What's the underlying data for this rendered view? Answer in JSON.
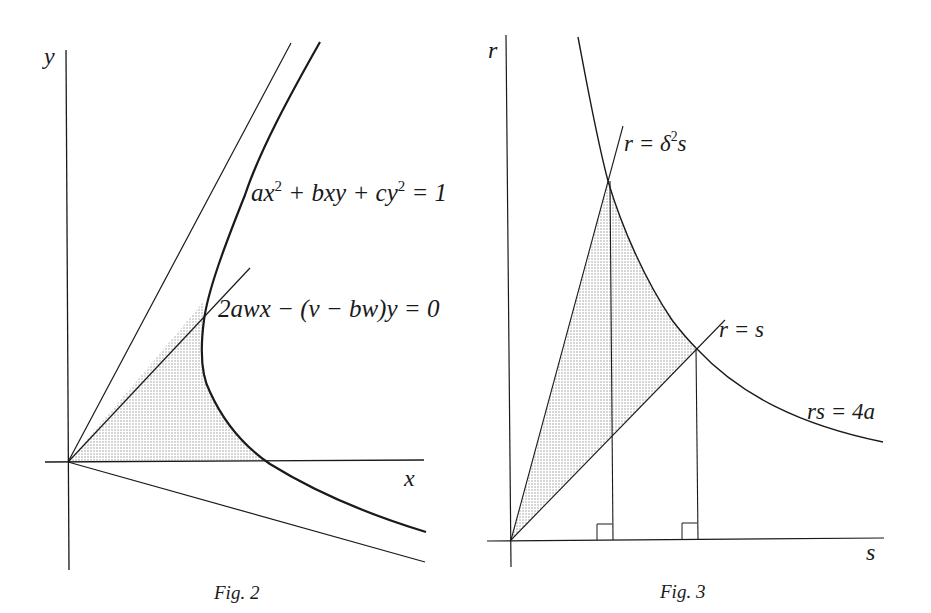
{
  "figures": [
    {
      "id": "fig2",
      "caption": "Fig. 2",
      "axes": {
        "x_label": "x",
        "y_label": "y"
      },
      "curves": [
        {
          "name": "hyperbola",
          "equation": {
            "pre": "ax",
            "sup1": "2",
            "mid": " + bxy + cy",
            "sup2": "2",
            "post": " = 1"
          }
        },
        {
          "name": "tangent-line",
          "equation": "2awx − (v − bw)y = 0"
        },
        {
          "name": "upper-asymptote",
          "equation": ""
        },
        {
          "name": "lower-asymptote",
          "equation": ""
        }
      ],
      "shaded_region": "area between x-axis, tangent line, and hyperbola"
    },
    {
      "id": "fig3",
      "caption": "Fig. 3",
      "axes": {
        "x_label": "s",
        "y_label": "r"
      },
      "curves": [
        {
          "name": "line-delta",
          "equation": {
            "pre": "r = δ",
            "sup": "2",
            "post": "s"
          }
        },
        {
          "name": "line-identity",
          "equation": "r = s"
        },
        {
          "name": "hyperbola",
          "equation": "rs = 4a"
        }
      ],
      "shaded_region": "area between r = δ²s, r = s and rs = 4a",
      "right_angle_markers": 2
    }
  ],
  "colors": {
    "ink": "#1a1a1a",
    "background": "#ffffff",
    "shade": "#d6d6d6"
  }
}
